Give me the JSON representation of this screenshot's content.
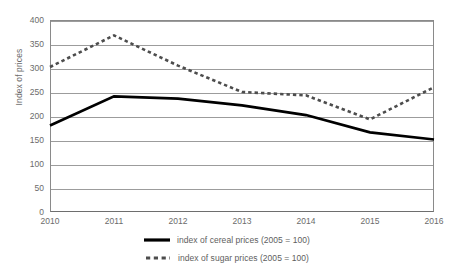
{
  "chart_data": {
    "type": "line",
    "title": "",
    "xlabel": "",
    "ylabel": "Index of prices",
    "categories": [
      "2010",
      "2011",
      "2012",
      "2013",
      "2014",
      "2015",
      "2016"
    ],
    "ylim": [
      0,
      400
    ],
    "ytick_labels": [
      "0",
      "50",
      "100",
      "150",
      "200",
      "250",
      "300",
      "350",
      "400"
    ],
    "ytick_values": [
      0,
      50,
      100,
      150,
      200,
      250,
      300,
      350,
      400
    ],
    "grid": true,
    "legend_position": "bottom",
    "series": [
      {
        "name": "index of cereal prices (2005 = 100)",
        "style": "solid",
        "color": "#000000",
        "values": [
          180,
          241,
          236,
          222,
          202,
          166,
          151
        ]
      },
      {
        "name": "index of sugar prices (2005 = 100)",
        "style": "dashed",
        "color": "#4d4d4d",
        "values": [
          302,
          368,
          305,
          250,
          243,
          193,
          260
        ]
      }
    ]
  },
  "legend": {
    "items": [
      {
        "label": "index of cereal prices (2005 = 100)",
        "swatch": "solid-line-swatch"
      },
      {
        "label": "index of sugar prices (2005 = 100)",
        "swatch": "dashed-line-swatch"
      }
    ]
  },
  "colors": {
    "background": "#ffffff",
    "gridline": "#9c9c9c",
    "axis": "#8a8a8a",
    "tick_text": "#6b6b6b",
    "cereal_line": "#000000",
    "sugar_line": "#4d4d4d"
  }
}
